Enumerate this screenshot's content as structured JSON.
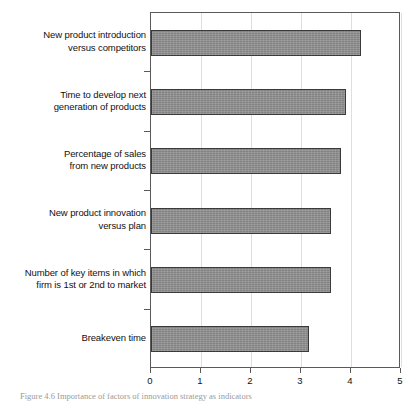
{
  "chart_data": {
    "type": "bar",
    "orientation": "horizontal",
    "title": "",
    "xlabel": "",
    "ylabel": "",
    "xlim": [
      0,
      5
    ],
    "ylim": null,
    "grid": "vertical",
    "legend": null,
    "xticks": [
      "0",
      "1",
      "2",
      "3",
      "4",
      "5"
    ],
    "xtick_values": [
      0,
      1,
      2,
      3,
      4,
      5
    ],
    "categories": [
      "New product introduction versus competitors",
      "Time to develop next generation of products",
      "Percentage of sales from new products",
      "New product innovation versus plan",
      "Number of key items in which firm is 1st or 2nd to market",
      "Breakeven time"
    ],
    "category_lines": [
      [
        "New product introduction",
        "versus competitors"
      ],
      [
        "Time to develop next",
        "generation of products"
      ],
      [
        "Percentage of sales",
        "from new products"
      ],
      [
        "New product innovation",
        "versus plan"
      ],
      [
        "Number of key items in which",
        "firm is 1st or 2nd to market"
      ],
      [
        "Breakeven time"
      ]
    ],
    "values": [
      4.2,
      3.9,
      3.8,
      3.6,
      3.6,
      3.15
    ],
    "bar_color": "#8d8d8d",
    "bar_border_color": "#3a3a3a",
    "gridline_color": "#dedede",
    "axis_color": "#5a5a5a"
  },
  "caption": {
    "text": "Figure 4.6 Importance of factors of innovation strategy as indicators"
  }
}
